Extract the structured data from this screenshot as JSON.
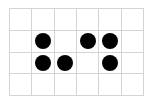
{
  "board": {
    "rows": 4,
    "cols": 6,
    "grid_color": "#d4d4d4",
    "dot_color": "#000000",
    "cells": [
      [
        0,
        0,
        0,
        0,
        0,
        0
      ],
      [
        0,
        1,
        0,
        1,
        1,
        0
      ],
      [
        0,
        1,
        1,
        0,
        1,
        0
      ],
      [
        0,
        0,
        0,
        0,
        0,
        0
      ]
    ]
  }
}
